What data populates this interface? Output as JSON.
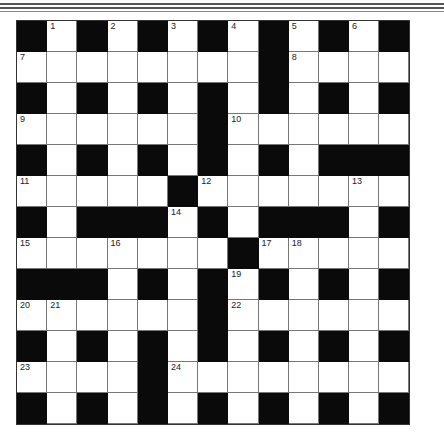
{
  "puzzle": {
    "rows": 13,
    "cols": 13,
    "layout": [
      "#.#.#.#.#.#.#",
      "........#....",
      "#.#.#.#.#.#.#",
      "......#......",
      "#.#.#.#.#.###",
      ".....#.......",
      "#.###.#.###.#",
      ".......#.....",
      "###.#.#.#.#.#",
      "......#......",
      "#.#.#.#.#.#.#",
      "....#........",
      "#.#.#.#.#.#.#"
    ],
    "numbers": [
      {
        "row": 0,
        "col": 1,
        "n": "1"
      },
      {
        "row": 0,
        "col": 3,
        "n": "2"
      },
      {
        "row": 0,
        "col": 5,
        "n": "3"
      },
      {
        "row": 0,
        "col": 7,
        "n": "4"
      },
      {
        "row": 0,
        "col": 9,
        "n": "5"
      },
      {
        "row": 0,
        "col": 11,
        "n": "6"
      },
      {
        "row": 1,
        "col": 0,
        "n": "7"
      },
      {
        "row": 1,
        "col": 9,
        "n": "8"
      },
      {
        "row": 3,
        "col": 0,
        "n": "9"
      },
      {
        "row": 3,
        "col": 7,
        "n": "10"
      },
      {
        "row": 5,
        "col": 0,
        "n": "11"
      },
      {
        "row": 5,
        "col": 6,
        "n": "12"
      },
      {
        "row": 5,
        "col": 11,
        "n": "13"
      },
      {
        "row": 6,
        "col": 5,
        "n": "14"
      },
      {
        "row": 7,
        "col": 0,
        "n": "15"
      },
      {
        "row": 7,
        "col": 3,
        "n": "16"
      },
      {
        "row": 7,
        "col": 8,
        "n": "17"
      },
      {
        "row": 7,
        "col": 9,
        "n": "18"
      },
      {
        "row": 8,
        "col": 7,
        "n": "19"
      },
      {
        "row": 9,
        "col": 0,
        "n": "20"
      },
      {
        "row": 9,
        "col": 1,
        "n": "21"
      },
      {
        "row": 9,
        "col": 7,
        "n": "22"
      },
      {
        "row": 11,
        "col": 0,
        "n": "23"
      },
      {
        "row": 11,
        "col": 5,
        "n": "24"
      }
    ]
  }
}
